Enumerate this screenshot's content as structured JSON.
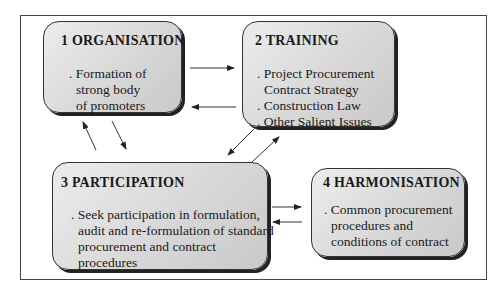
{
  "diagram": {
    "boxes": [
      {
        "id": "organisation",
        "title": "1  ORGANISATION",
        "lines": [
          ". Formation of",
          "strong body",
          "of promoters"
        ]
      },
      {
        "id": "training",
        "title": "2  TRAINING",
        "lines": [
          ". Project Procurement",
          "Contract Strategy",
          ". Construction Law",
          ". Other Salient Issues"
        ]
      },
      {
        "id": "participation",
        "title": "3  PARTICIPATION",
        "lines": [
          ". Seek participation in formulation,",
          "audit and re-formulation of standard",
          "procurement and contract",
          "procedures"
        ]
      },
      {
        "id": "harmonisation",
        "title": "4  HARMONISATION",
        "lines": [
          ". Common procurement",
          "procedures and",
          "conditions of contract"
        ]
      }
    ],
    "connections": [
      {
        "from": "organisation",
        "to": "training"
      },
      {
        "from": "training",
        "to": "organisation"
      },
      {
        "from": "organisation",
        "to": "participation"
      },
      {
        "from": "participation",
        "to": "organisation"
      },
      {
        "from": "training",
        "to": "participation"
      },
      {
        "from": "participation",
        "to": "training"
      },
      {
        "from": "participation",
        "to": "harmonisation"
      },
      {
        "from": "harmonisation",
        "to": "participation"
      }
    ],
    "colors": {
      "box_fill": "#d9d9d9",
      "box_border": "#333333",
      "shadow": "#222222",
      "frame_border": "#444444"
    }
  }
}
